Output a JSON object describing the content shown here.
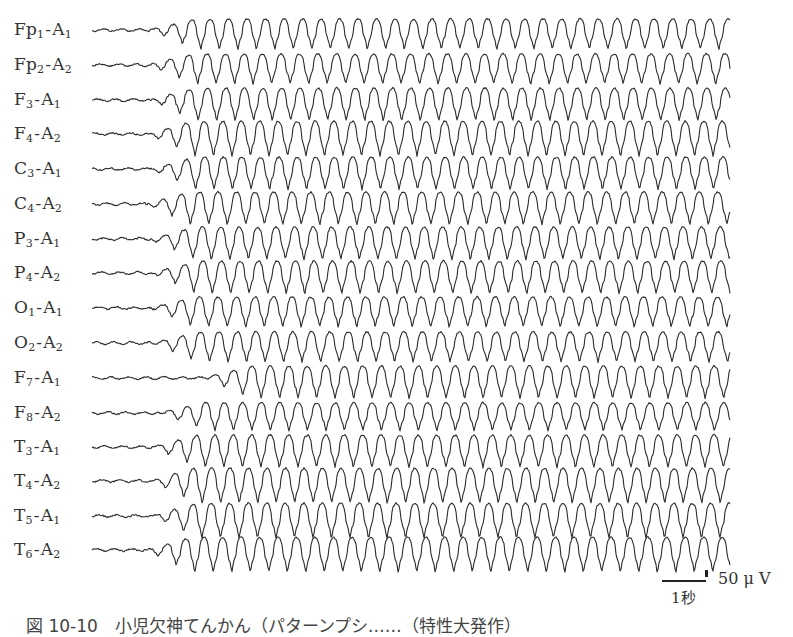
{
  "figure": {
    "caption": "図 10-10　小児欠神てんかん（パターンプシ……（特性大発作）",
    "scale_bar": {
      "time_label": "1秒",
      "voltage_label": "50 μ V"
    },
    "trace_color": "#2b2b2b",
    "trace_start_x": 92,
    "trace_end_x": 730,
    "channels": [
      {
        "electrode": "Fp",
        "e_sub": "1",
        "ref": "A",
        "r_sub": "1",
        "y": 30,
        "onset": 150,
        "amp": 13,
        "period": 18.5,
        "phase": 0.0
      },
      {
        "electrode": "Fp",
        "e_sub": "2",
        "ref": "A",
        "r_sub": "2",
        "y": 65,
        "onset": 148,
        "amp": 13,
        "period": 18.5,
        "phase": 0.4
      },
      {
        "electrode": "F",
        "e_sub": "3",
        "ref": "A",
        "r_sub": "1",
        "y": 100,
        "onset": 150,
        "amp": 14,
        "period": 18.5,
        "phase": 0.9
      },
      {
        "electrode": "F",
        "e_sub": "4",
        "ref": "A",
        "r_sub": "2",
        "y": 134,
        "onset": 148,
        "amp": 15,
        "period": 18.5,
        "phase": 1.3
      },
      {
        "electrode": "C",
        "e_sub": "3",
        "ref": "A",
        "r_sub": "1",
        "y": 169,
        "onset": 150,
        "amp": 14,
        "period": 18.5,
        "phase": 1.8
      },
      {
        "electrode": "C",
        "e_sub": "4",
        "ref": "A",
        "r_sub": "2",
        "y": 204,
        "onset": 146,
        "amp": 14,
        "period": 18.5,
        "phase": 2.2
      },
      {
        "electrode": "P",
        "e_sub": "3",
        "ref": "A",
        "r_sub": "1",
        "y": 239,
        "onset": 150,
        "amp": 14,
        "period": 18.5,
        "phase": 2.7
      },
      {
        "electrode": "P",
        "e_sub": "4",
        "ref": "A",
        "r_sub": "2",
        "y": 273,
        "onset": 152,
        "amp": 14,
        "period": 18.5,
        "phase": 3.1
      },
      {
        "electrode": "O",
        "e_sub": "1",
        "ref": "A",
        "r_sub": "1",
        "y": 308,
        "onset": 150,
        "amp": 13,
        "period": 18.5,
        "phase": 3.6
      },
      {
        "electrode": "O",
        "e_sub": "2",
        "ref": "A",
        "r_sub": "2",
        "y": 343,
        "onset": 152,
        "amp": 13,
        "period": 18.5,
        "phase": 4.0
      },
      {
        "electrode": "F",
        "e_sub": "7",
        "ref": "A",
        "r_sub": "1",
        "y": 378,
        "onset": 205,
        "amp": 14,
        "period": 18.5,
        "phase": 4.5
      },
      {
        "electrode": "F",
        "e_sub": "8",
        "ref": "A",
        "r_sub": "2",
        "y": 413,
        "onset": 160,
        "amp": 12,
        "period": 18.5,
        "phase": 4.9
      },
      {
        "electrode": "T",
        "e_sub": "3",
        "ref": "A",
        "r_sub": "1",
        "y": 447,
        "onset": 152,
        "amp": 14,
        "period": 18.5,
        "phase": 5.4
      },
      {
        "electrode": "T",
        "e_sub": "4",
        "ref": "A",
        "r_sub": "2",
        "y": 481,
        "onset": 150,
        "amp": 15,
        "period": 18.5,
        "phase": 5.8
      },
      {
        "electrode": "T",
        "e_sub": "5",
        "ref": "A",
        "r_sub": "1",
        "y": 516,
        "onset": 152,
        "amp": 15,
        "period": 18.5,
        "phase": 0.3
      },
      {
        "electrode": "T",
        "e_sub": "6",
        "ref": "A",
        "r_sub": "2",
        "y": 550,
        "onset": 146,
        "amp": 15,
        "period": 18.5,
        "phase": 0.7
      }
    ]
  }
}
